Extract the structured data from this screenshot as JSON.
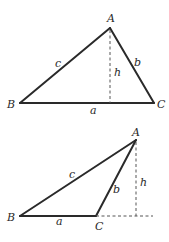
{
  "diagrams": [
    {
      "name": "acute-triangle",
      "vertices": {
        "A": "A",
        "B": "B",
        "C": "C"
      },
      "sides": {
        "a": "a",
        "b": "b",
        "c": "c"
      },
      "height": "h",
      "description": "Triangle ABC with altitude h from A falling inside base BC"
    },
    {
      "name": "obtuse-triangle",
      "vertices": {
        "A": "A",
        "B": "B",
        "C": "C"
      },
      "sides": {
        "a": "a",
        "b": "b",
        "c": "c"
      },
      "height": "h",
      "description": "Triangle ABC with obtuse angle at C; altitude h from A falls outside, on extension of BC"
    }
  ]
}
